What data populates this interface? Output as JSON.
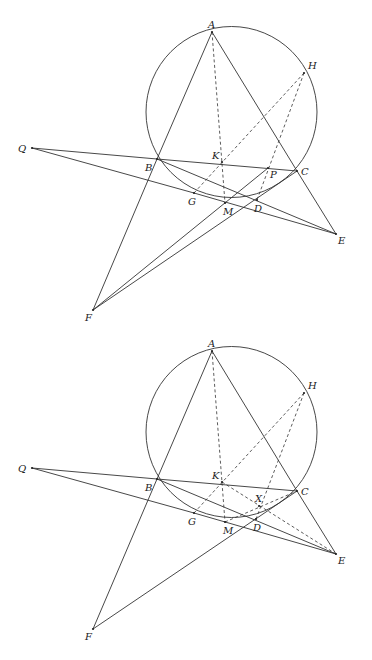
{
  "figures": [
    {
      "id": "figure-1",
      "circle": {
        "cx": 231.5,
        "cy": 112,
        "r": 85.5
      },
      "points": {
        "A": [
          212,
          32
        ],
        "H": [
          304,
          73
        ],
        "Q": [
          32,
          148
        ],
        "B": [
          157,
          159
        ],
        "K": [
          222,
          162
        ],
        "P": [
          268,
          168
        ],
        "C": [
          297,
          171
        ],
        "G": [
          194,
          193
        ],
        "M": [
          225,
          203
        ],
        "D": [
          257,
          200
        ],
        "E": [
          336,
          234
        ],
        "F": [
          93,
          310
        ]
      },
      "labels": {
        "A": {
          "text": "A",
          "dx": -4,
          "dy": -4
        },
        "H": {
          "text": "H",
          "dx": 4,
          "dy": -4
        },
        "Q": {
          "text": "Q",
          "dx": -14,
          "dy": 4
        },
        "B": {
          "text": "B",
          "dx": -12,
          "dy": 12
        },
        "K": {
          "text": "K",
          "dx": -10,
          "dy": -3
        },
        "P": {
          "text": "P",
          "dx": 2,
          "dy": 10
        },
        "C": {
          "text": "C",
          "dx": 4,
          "dy": 4
        },
        "G": {
          "text": "G",
          "dx": -6,
          "dy": 12
        },
        "M": {
          "text": "M",
          "dx": -2,
          "dy": 12
        },
        "D": {
          "text": "D",
          "dx": -3,
          "dy": 12
        },
        "E": {
          "text": "E",
          "dx": 2,
          "dy": 10
        },
        "F": {
          "text": "F",
          "dx": -8,
          "dy": 11
        }
      },
      "solid_segments": [
        [
          "A",
          "B"
        ],
        [
          "B",
          "F"
        ],
        [
          "A",
          "C"
        ],
        [
          "C",
          "E"
        ],
        [
          "Q",
          "B"
        ],
        [
          "B",
          "C"
        ],
        [
          "Q",
          "G"
        ],
        [
          "G",
          "E"
        ],
        [
          "B",
          "E"
        ],
        [
          "F",
          "P"
        ],
        [
          "F",
          "C"
        ]
      ],
      "dashed_segments": [
        [
          "A",
          "M"
        ],
        [
          "H",
          "G"
        ],
        [
          "H",
          "D"
        ]
      ]
    },
    {
      "id": "figure-2",
      "circle": {
        "cx": 231.5,
        "cy": 432,
        "r": 85.5
      },
      "points": {
        "A": [
          212,
          351
        ],
        "H": [
          304,
          393
        ],
        "Q": [
          32,
          468
        ],
        "B": [
          157,
          479
        ],
        "K": [
          222,
          482
        ],
        "X": [
          259,
          506
        ],
        "C": [
          297,
          491
        ],
        "G": [
          194,
          513
        ],
        "M": [
          225,
          522
        ],
        "D": [
          256,
          519
        ],
        "E": [
          336,
          554
        ],
        "F": [
          93,
          629
        ]
      },
      "labels": {
        "A": {
          "text": "A",
          "dx": -4,
          "dy": -4
        },
        "H": {
          "text": "H",
          "dx": 4,
          "dy": -4
        },
        "Q": {
          "text": "Q",
          "dx": -14,
          "dy": 4
        },
        "B": {
          "text": "B",
          "dx": -12,
          "dy": 12
        },
        "K": {
          "text": "K",
          "dx": -10,
          "dy": -3
        },
        "X": {
          "text": "X",
          "dx": -4,
          "dy": -4
        },
        "C": {
          "text": "C",
          "dx": 4,
          "dy": 4
        },
        "G": {
          "text": "G",
          "dx": -6,
          "dy": 12
        },
        "M": {
          "text": "M",
          "dx": -2,
          "dy": 12
        },
        "D": {
          "text": "D",
          "dx": -3,
          "dy": 12
        },
        "E": {
          "text": "E",
          "dx": 2,
          "dy": 10
        },
        "F": {
          "text": "F",
          "dx": -8,
          "dy": 11
        }
      },
      "solid_segments": [
        [
          "A",
          "B"
        ],
        [
          "B",
          "F"
        ],
        [
          "A",
          "C"
        ],
        [
          "C",
          "E"
        ],
        [
          "Q",
          "B"
        ],
        [
          "B",
          "C"
        ],
        [
          "Q",
          "G"
        ],
        [
          "G",
          "E"
        ],
        [
          "B",
          "E"
        ],
        [
          "F",
          "C"
        ]
      ],
      "dashed_segments": [
        [
          "A",
          "M"
        ],
        [
          "H",
          "G"
        ],
        [
          "H",
          "D"
        ],
        [
          "K",
          "E"
        ],
        [
          "M",
          "C"
        ]
      ]
    }
  ]
}
